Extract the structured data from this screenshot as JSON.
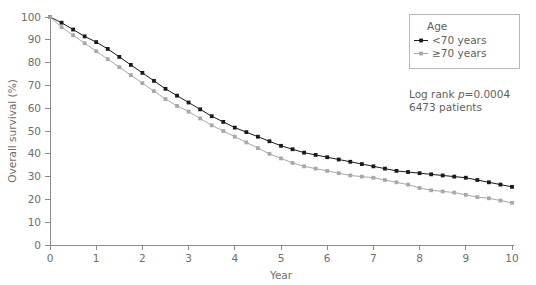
{
  "chart_data": {
    "type": "line",
    "title": "",
    "xlabel": "Year",
    "ylabel": "Overall survival (%)",
    "xlim": [
      0,
      10
    ],
    "ylim": [
      0,
      100
    ],
    "xticks": [
      "0",
      "1",
      "2",
      "3",
      "4",
      "5",
      "6",
      "7",
      "8",
      "9",
      "10"
    ],
    "yticks": [
      "0",
      "10",
      "20",
      "30",
      "40",
      "50",
      "60",
      "70",
      "80",
      "90",
      "100"
    ],
    "grid": false,
    "legend_position": "top-right",
    "legend_title": "Age",
    "series": [
      {
        "name": "<70 years",
        "color": "#1a1a1a",
        "marker": "square",
        "x": [
          0,
          0.25,
          0.5,
          0.75,
          1,
          1.25,
          1.5,
          1.75,
          2,
          2.25,
          2.5,
          2.75,
          3,
          3.25,
          3.5,
          3.75,
          4,
          4.25,
          4.5,
          4.75,
          5,
          5.25,
          5.5,
          5.75,
          6,
          6.25,
          6.5,
          6.75,
          7,
          7.25,
          7.5,
          7.75,
          8,
          8.25,
          8.5,
          8.75,
          9,
          9.25,
          9.5,
          9.75,
          10
        ],
        "values": [
          100,
          97.5,
          94.5,
          91.5,
          89,
          86,
          82.5,
          79,
          75.5,
          72,
          68.5,
          65.5,
          62.5,
          59.5,
          56.5,
          54,
          51.5,
          49.5,
          47.5,
          45.5,
          43.5,
          42,
          40.5,
          39.5,
          38.5,
          37.5,
          36.5,
          35.5,
          34.5,
          33.5,
          32.5,
          32,
          31.5,
          31,
          30.5,
          30,
          29.5,
          28.5,
          27.5,
          26.5,
          25.5
        ]
      },
      {
        "name": "≥70 years",
        "color": "#a8a8a8",
        "marker": "square",
        "x": [
          0,
          0.25,
          0.5,
          0.75,
          1,
          1.25,
          1.5,
          1.75,
          2,
          2.25,
          2.5,
          2.75,
          3,
          3.25,
          3.5,
          3.75,
          4,
          4.25,
          4.5,
          4.75,
          5,
          5.25,
          5.5,
          5.75,
          6,
          6.25,
          6.5,
          6.75,
          7,
          7.25,
          7.5,
          7.75,
          8,
          8.25,
          8.5,
          8.75,
          9,
          9.25,
          9.5,
          9.75,
          10
        ],
        "values": [
          100,
          95.5,
          92,
          88.5,
          85,
          81.5,
          78,
          74.5,
          71,
          67.5,
          64,
          61,
          58.5,
          55.5,
          52.5,
          50,
          47.5,
          45,
          42.5,
          40,
          38,
          36,
          34.5,
          33.5,
          32.5,
          31.5,
          30.5,
          30,
          29.5,
          28.5,
          27.5,
          26.5,
          25,
          24,
          23.5,
          23,
          22,
          21,
          20.5,
          19.5,
          18.5
        ]
      }
    ],
    "annotations": [
      {
        "text": "Log rank p=0.0004",
        "prefix": "Log rank ",
        "italic": "p",
        "suffix": "=0.0004"
      },
      {
        "text": "6473 patients"
      }
    ]
  },
  "legend": {
    "title": "Age",
    "entries": [
      {
        "label": "<70 years",
        "color": "#1a1a1a"
      },
      {
        "label": "≥70 years",
        "color": "#a8a8a8"
      }
    ]
  },
  "annotation": {
    "logrank_prefix": "Log rank ",
    "logrank_p": "p",
    "logrank_value": "=0.0004",
    "patients": "6473 patients"
  },
  "axes": {
    "x_title": "Year",
    "y_title": "Overall survival (%)"
  }
}
